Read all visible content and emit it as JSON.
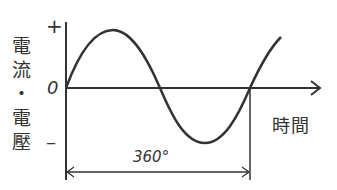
{
  "diagram": {
    "y_axis_label_chars": [
      "電",
      "流",
      "・",
      "電",
      "壓"
    ],
    "y_axis_label": "電流・電壓",
    "x_axis_label": "時間",
    "y_ticks": {
      "positive": "+",
      "zero": "0",
      "negative": "–"
    },
    "period_label": "360°",
    "curve": "sine wave",
    "colors": {
      "line": "#333333",
      "background": "#ffffff"
    }
  }
}
